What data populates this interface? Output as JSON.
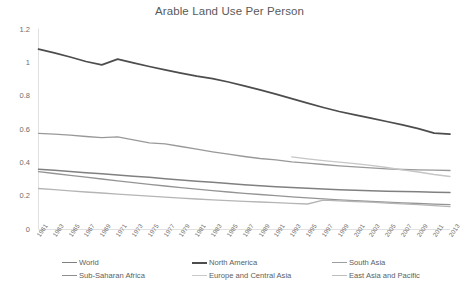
{
  "chart_data": {
    "type": "line",
    "title": "Arable Land Use Per Person",
    "xlabel": "",
    "ylabel": "",
    "ylim": [
      0,
      1.2
    ],
    "yticks": [
      0,
      0.2,
      0.4,
      0.6,
      0.8,
      1,
      1.2
    ],
    "ytick_labels": [
      "0",
      "0.2",
      "0.4",
      "0.6",
      "0.8",
      "1",
      "1.2"
    ],
    "grid": false,
    "legend_position": "bottom",
    "x": [
      1961,
      1963,
      1965,
      1967,
      1969,
      1971,
      1973,
      1975,
      1977,
      1979,
      1981,
      1983,
      1985,
      1987,
      1989,
      1991,
      1993,
      1995,
      1997,
      1999,
      2001,
      2003,
      2005,
      2007,
      2009,
      2011,
      2013
    ],
    "xtick_labels": [
      "1961",
      "1963",
      "1965",
      "1967",
      "1969",
      "1971",
      "1973",
      "1975",
      "1977",
      "1979",
      "1981",
      "1983",
      "1985",
      "1987",
      "1989",
      "1991",
      "1993",
      "1995",
      "1997",
      "1999",
      "2001",
      "2003",
      "2005",
      "2007",
      "2009",
      "2011",
      "2013"
    ],
    "series": [
      {
        "name": "World",
        "color": "#808080",
        "width": 1.5,
        "values": [
          0.362,
          0.355,
          0.348,
          0.341,
          0.334,
          0.327,
          0.32,
          0.313,
          0.305,
          0.297,
          0.29,
          0.283,
          0.276,
          0.269,
          0.263,
          0.257,
          0.252,
          0.247,
          0.243,
          0.239,
          0.236,
          0.233,
          0.23,
          0.228,
          0.226,
          0.224,
          0.222
        ]
      },
      {
        "name": "North America",
        "color": "#4d4d4d",
        "width": 1.7,
        "values": [
          1.082,
          1.06,
          1.035,
          1.008,
          0.988,
          1.022,
          1.0,
          0.978,
          0.958,
          0.938,
          0.92,
          0.905,
          0.885,
          0.862,
          0.838,
          0.812,
          0.785,
          0.758,
          0.732,
          0.708,
          0.688,
          0.668,
          0.648,
          0.628,
          0.605,
          0.578,
          0.572
        ]
      },
      {
        "name": "South Asia",
        "color": "#999999",
        "width": 1.3,
        "values": [
          0.577,
          0.572,
          0.566,
          0.558,
          0.551,
          0.556,
          0.538,
          0.52,
          0.514,
          0.498,
          0.482,
          0.466,
          0.452,
          0.438,
          0.426,
          0.418,
          0.406,
          0.398,
          0.39,
          0.382,
          0.376,
          0.37,
          0.364,
          0.36,
          0.358,
          0.356,
          0.354
        ]
      },
      {
        "name": "Sub-Saharan Africa",
        "color": "#949494",
        "width": 1.3,
        "values": [
          0.347,
          0.336,
          0.325,
          0.314,
          0.303,
          0.292,
          0.281,
          0.271,
          0.261,
          0.251,
          0.242,
          0.233,
          0.225,
          0.217,
          0.21,
          0.203,
          0.196,
          0.19,
          0.184,
          0.178,
          0.173,
          0.168,
          0.164,
          0.16,
          0.156,
          0.152,
          0.149
        ]
      },
      {
        "name": "Europe and Central Asia",
        "color": "#c6c6c6",
        "width": 1.3,
        "start_year": 1992,
        "values": [
          null,
          null,
          null,
          null,
          null,
          null,
          null,
          null,
          null,
          null,
          null,
          null,
          null,
          null,
          null,
          null,
          0.436,
          0.424,
          0.413,
          0.404,
          0.395,
          0.385,
          0.372,
          0.358,
          0.345,
          0.33,
          0.318
        ]
      },
      {
        "name": "East Asia and Pacific",
        "color": "#b5b5b5",
        "width": 1.3,
        "values": [
          0.246,
          0.239,
          0.232,
          0.225,
          0.219,
          0.212,
          0.206,
          0.2,
          0.194,
          0.188,
          0.183,
          0.178,
          0.173,
          0.169,
          0.165,
          0.161,
          0.157,
          0.153,
          0.176,
          0.172,
          0.168,
          0.164,
          0.159,
          0.154,
          0.149,
          0.143,
          0.137
        ]
      }
    ]
  },
  "legend": {
    "rows": [
      [
        {
          "label": "World",
          "color": "#808080",
          "width": 1.8
        },
        {
          "label": "North America",
          "color": "#4d4d4d",
          "width": 2.2
        },
        {
          "label": "South Asia",
          "color": "#9e9e9e",
          "width": 1.4
        }
      ],
      [
        {
          "label": "Sub-Saharan Africa",
          "color": "#8e8e8e",
          "width": 1.4
        },
        {
          "label": "Europe and Central Asia",
          "color": "#c9c9c9",
          "width": 1.3
        },
        {
          "label": "East Asia and Pacific",
          "color": "#bdbdbd",
          "width": 1.3
        }
      ]
    ]
  }
}
